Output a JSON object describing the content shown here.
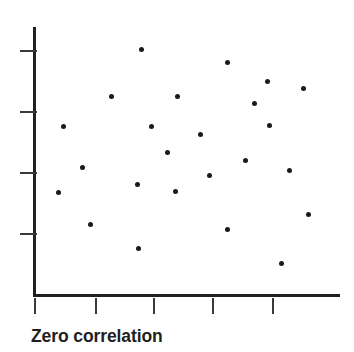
{
  "caption": "Zero correlation",
  "colors": {
    "point": "#1a1a1a",
    "axis": "#231f20",
    "tick": "#3a3a3a",
    "background": "#ffffff",
    "caption": "#231f20"
  },
  "chart_data": {
    "type": "scatter",
    "title": "Zero correlation",
    "xlabel": "",
    "ylabel": "",
    "grid": false,
    "legend": null,
    "axis_tick_labels": {
      "x": [],
      "y": []
    },
    "xlim": [
      0,
      10
    ],
    "ylim": [
      0,
      10
    ],
    "n_points": 24,
    "correlation": 0,
    "note": "Points scattered with no linear trend; axes unlabeled with bare tick marks.",
    "x_tick_positions_px": [
      34,
      95,
      153,
      212,
      272
    ],
    "y_tick_positions_px": [
      50,
      111,
      172,
      233
    ],
    "axis_geometry_px": {
      "y_axis_x": 34,
      "y_axis_top": 27,
      "x_axis_y": 295,
      "x_axis_right": 340
    },
    "points_px": [
      {
        "x": 141,
        "y": 49
      },
      {
        "x": 227,
        "y": 62
      },
      {
        "x": 267,
        "y": 81
      },
      {
        "x": 303,
        "y": 88
      },
      {
        "x": 111,
        "y": 96
      },
      {
        "x": 177,
        "y": 96
      },
      {
        "x": 254,
        "y": 103
      },
      {
        "x": 63,
        "y": 126
      },
      {
        "x": 151,
        "y": 126
      },
      {
        "x": 269,
        "y": 125
      },
      {
        "x": 200,
        "y": 134
      },
      {
        "x": 167,
        "y": 152
      },
      {
        "x": 82,
        "y": 167
      },
      {
        "x": 245,
        "y": 160
      },
      {
        "x": 289,
        "y": 170
      },
      {
        "x": 58,
        "y": 192
      },
      {
        "x": 209,
        "y": 175
      },
      {
        "x": 137,
        "y": 184
      },
      {
        "x": 175,
        "y": 191
      },
      {
        "x": 308,
        "y": 214
      },
      {
        "x": 90,
        "y": 224
      },
      {
        "x": 227,
        "y": 229
      },
      {
        "x": 138,
        "y": 248
      },
      {
        "x": 281,
        "y": 263
      }
    ],
    "points": [
      {
        "x": 3.5,
        "y": 9.18
      },
      {
        "x": 6.31,
        "y": 8.69
      },
      {
        "x": 7.62,
        "y": 7.98
      },
      {
        "x": 8.79,
        "y": 7.72
      },
      {
        "x": 2.52,
        "y": 7.43
      },
      {
        "x": 4.68,
        "y": 7.43
      },
      {
        "x": 7.19,
        "y": 7.17
      },
      {
        "x": 0.95,
        "y": 6.31
      },
      {
        "x": 3.83,
        "y": 6.31
      },
      {
        "x": 7.69,
        "y": 6.35
      },
      {
        "x": 5.43,
        "y": 6.01
      },
      {
        "x": 4.35,
        "y": 5.34
      },
      {
        "x": 1.57,
        "y": 4.79
      },
      {
        "x": 6.92,
        "y": 5.04
      },
      {
        "x": 8.36,
        "y": 4.66
      },
      {
        "x": 0.79,
        "y": 3.84
      },
      {
        "x": 5.73,
        "y": 4.48
      },
      {
        "x": 3.37,
        "y": 4.15
      },
      {
        "x": 4.61,
        "y": 3.88
      },
      {
        "x": 8.98,
        "y": 3.02
      },
      {
        "x": 1.83,
        "y": 2.65
      },
      {
        "x": 6.31,
        "y": 2.46
      },
      {
        "x": 3.4,
        "y": 1.75
      },
      {
        "x": 8.07,
        "y": 1.19
      }
    ]
  }
}
